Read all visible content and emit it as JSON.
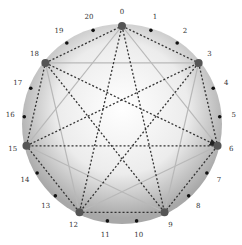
{
  "diagram": {
    "type": "circular-star-polygon",
    "point_count": 21,
    "center": [
      122,
      124
    ],
    "radius": 98,
    "label_radius": 112,
    "labels": [
      "0",
      "1",
      "2",
      "3",
      "4",
      "5",
      "6",
      "7",
      "8",
      "9",
      "10",
      "11",
      "12",
      "13",
      "14",
      "15",
      "16",
      "17",
      "18",
      "19",
      "20"
    ],
    "major_nodes": [
      0,
      3,
      6,
      9,
      12,
      15,
      18
    ],
    "dashed_heptagon": [
      0,
      3,
      6,
      9,
      12,
      15,
      18,
      0
    ],
    "dashed_star": [
      0,
      9,
      18,
      6,
      15,
      3,
      12,
      0
    ],
    "solid_star": [
      0,
      6,
      12,
      18,
      3,
      9,
      15,
      0
    ],
    "arrows": [
      {
        "from": 18,
        "to": 6
      },
      {
        "from": 3,
        "to": 15
      },
      {
        "from": 12,
        "to": 18
      }
    ],
    "colors": {
      "disc_outer": "#9a9a9a",
      "disc_inner": "#ffffff",
      "dashed": "#333333",
      "solid": "#b8b8b8",
      "minor_node": "#111111",
      "major_node": "#555555"
    }
  }
}
